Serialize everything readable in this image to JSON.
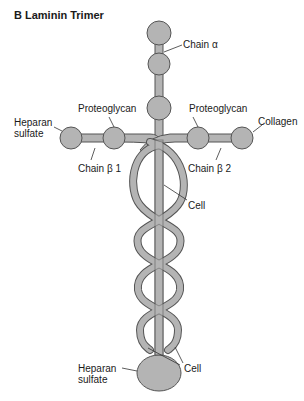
{
  "figure": {
    "title": "B  Laminin Trimer"
  },
  "labels": {
    "chain_alpha": "Chain α",
    "proteoglycan_left": "Proteoglycan",
    "proteoglycan_right": "Proteoglycan",
    "heparan_top_line1": "Heparan",
    "heparan_top_line2": "sulfate",
    "collagen": "Collagen",
    "chain_beta1": "Chain β 1",
    "chain_beta2": "Chain β 2",
    "cell_upper": "Cell",
    "cell_lower": "Cell",
    "heparan_bottom_line1": "Heparan",
    "heparan_bottom_line2": "sulfate"
  },
  "colors": {
    "fill": "#b4b4b4",
    "stroke": "#555555",
    "text": "#1a1a1a"
  }
}
